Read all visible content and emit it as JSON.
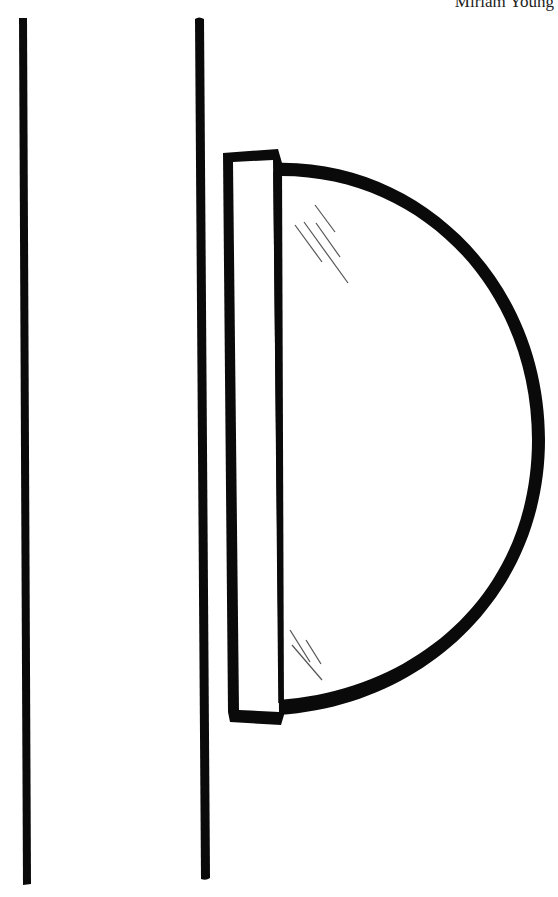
{
  "credit": "Miriam Young",
  "drawing": {
    "subject": "half-round mirror mounted on wall between two vertical lines",
    "stroke_color": "#0a0a0a",
    "background": "#ffffff"
  }
}
